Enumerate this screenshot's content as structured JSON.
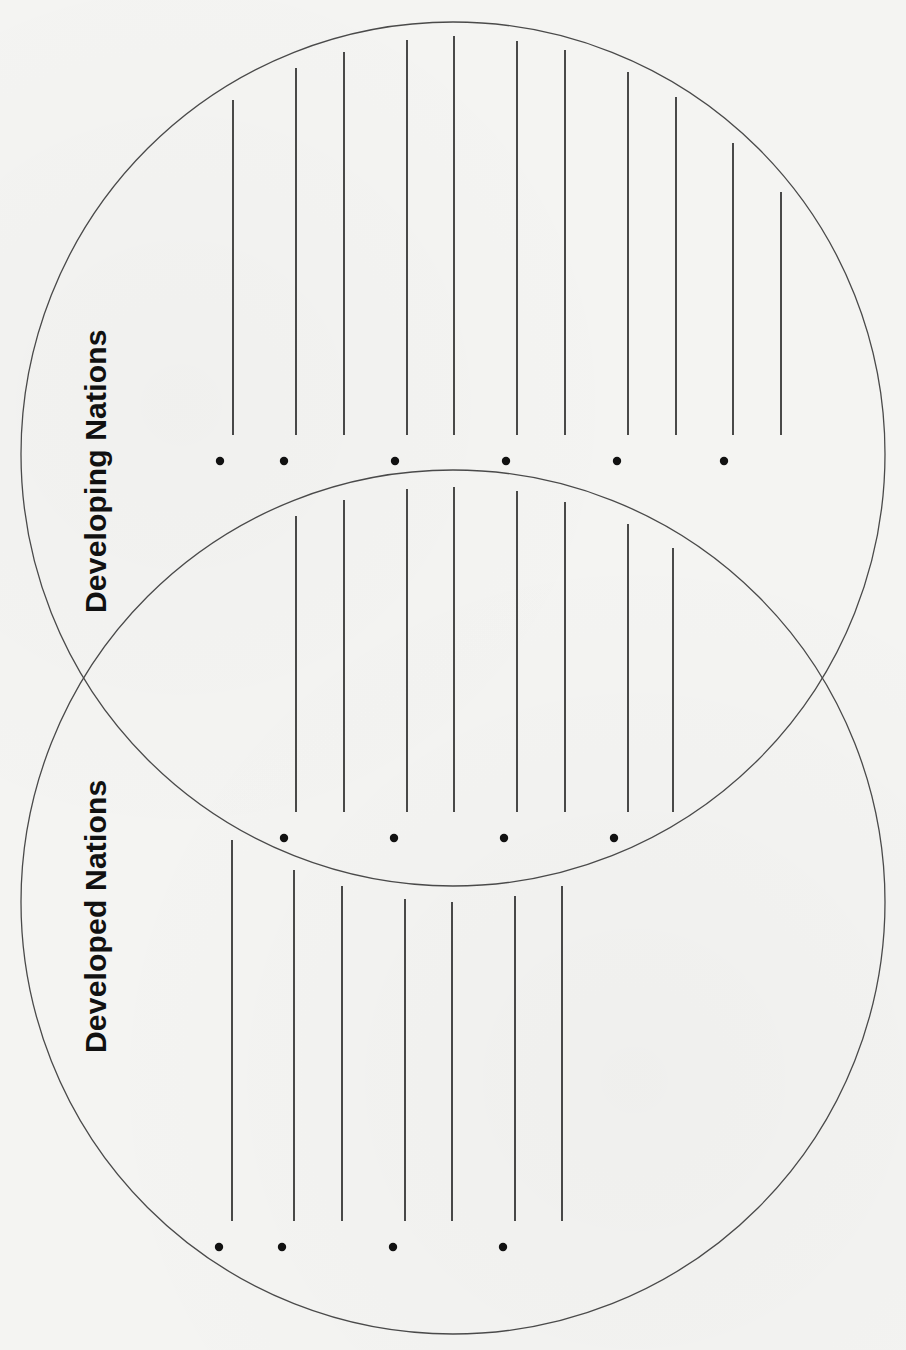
{
  "diagram": {
    "type": "venn-diagram-worksheet",
    "orientation": "rotated-90-ccw",
    "circles": [
      {
        "id": "developing",
        "label": "Developing Nations",
        "cx": 453,
        "cy": 454,
        "r": 432
      },
      {
        "id": "developed",
        "label": "Developed Nations",
        "cx": 453,
        "cy": 902,
        "r": 432
      }
    ],
    "labels": {
      "developing": "Developing Nations",
      "developed": "Developed Nations"
    },
    "colors": {
      "background": "#f4f4f2",
      "outline": "#4a4a4a",
      "lines": "#1e1e1e",
      "text": "#111111"
    },
    "sections": {
      "developing_only": {
        "line_bottom": 435,
        "lines": [
          {
            "x": 233,
            "top": 100
          },
          {
            "x": 296,
            "top": 68
          },
          {
            "x": 344,
            "top": 52
          },
          {
            "x": 407,
            "top": 40
          },
          {
            "x": 454,
            "top": 36
          },
          {
            "x": 517,
            "top": 41
          },
          {
            "x": 565,
            "top": 50
          },
          {
            "x": 628,
            "top": 72
          },
          {
            "x": 676,
            "top": 97
          },
          {
            "x": 733,
            "top": 143
          },
          {
            "x": 781,
            "top": 192
          }
        ],
        "bullets": {
          "y": 461,
          "xs": [
            220,
            284,
            395,
            506,
            617,
            724
          ]
        }
      },
      "overlap_both": {
        "line_bottom": 812,
        "lines": [
          {
            "x": 296,
            "top": 516
          },
          {
            "x": 344,
            "top": 500
          },
          {
            "x": 407,
            "top": 489
          },
          {
            "x": 454,
            "top": 487
          },
          {
            "x": 517,
            "top": 491
          },
          {
            "x": 565,
            "top": 502
          },
          {
            "x": 628,
            "top": 524
          },
          {
            "x": 673,
            "top": 548
          }
        ],
        "bullets": {
          "y": 838,
          "xs": [
            284,
            394,
            504,
            614
          ]
        }
      },
      "developed_only": {
        "line_bottom": 1221,
        "lines": [
          {
            "x": 232,
            "top": 840
          },
          {
            "x": 294,
            "top": 870
          },
          {
            "x": 342,
            "top": 886
          },
          {
            "x": 405,
            "top": 899
          },
          {
            "x": 452,
            "top": 902
          },
          {
            "x": 515,
            "top": 896
          },
          {
            "x": 562,
            "top": 886
          }
        ],
        "bullets": {
          "y": 1247,
          "xs": [
            219,
            282,
            393,
            503
          ]
        }
      }
    }
  }
}
